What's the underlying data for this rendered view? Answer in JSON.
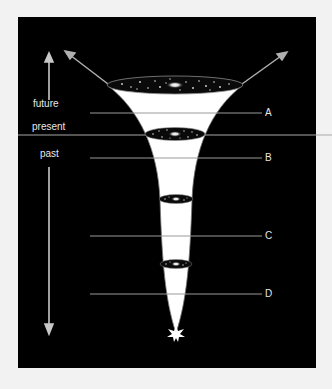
{
  "diagram": {
    "time_labels": {
      "future": "future",
      "present": "present",
      "past": "past"
    },
    "epoch_markers": [
      {
        "label": "A",
        "y": 113
      },
      {
        "label": "B",
        "y": 158
      },
      {
        "label": "C",
        "y": 236
      },
      {
        "label": "D",
        "y": 294
      }
    ],
    "colors": {
      "background": "#000000",
      "page": "#f2f2f2",
      "lines": "#9a9a9a",
      "text": "#e6e6e6",
      "cone_top": "#3a3a3a",
      "cone_bottom": "#f0f0f0"
    }
  }
}
